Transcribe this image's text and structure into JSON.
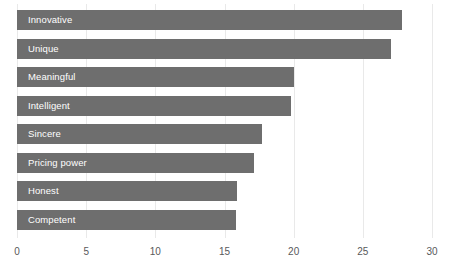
{
  "chart_data": {
    "type": "bar",
    "orientation": "horizontal",
    "title": "",
    "subtitle": "",
    "xlabel": "",
    "ylabel": "",
    "categories": [
      "Innovative",
      "Unique",
      "Meaningful",
      "Intelligent",
      "Sincere",
      "Pricing power",
      "Honest",
      "Competent"
    ],
    "values": [
      27.8,
      27.0,
      20.0,
      19.8,
      17.7,
      17.1,
      15.9,
      15.8
    ],
    "xlim": [
      0,
      30
    ],
    "xticks": [
      0,
      5,
      10,
      15,
      20,
      25,
      30
    ],
    "xtick_labels": [
      "0",
      "5",
      "10",
      "15",
      "20",
      "25",
      "30"
    ],
    "grid": true,
    "grid_axis": "x",
    "legend": false,
    "bar_color": "#6e6e6e",
    "bar_label_color": "#ffffff",
    "gridline_color": "#e9e9e9",
    "tick_label_color": "#58595b",
    "background_color": "#ffffff"
  }
}
